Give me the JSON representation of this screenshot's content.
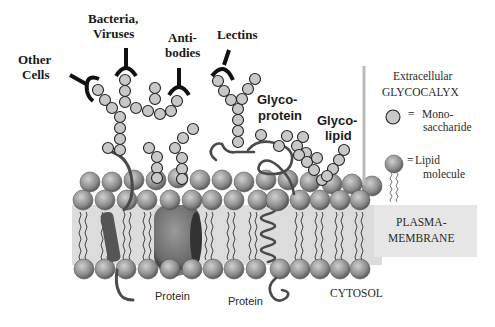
{
  "diagram": {
    "labels": {
      "other_cells_1": "Other",
      "other_cells_2": "Cells",
      "bacteria_1": "Bacteria,",
      "bacteria_2": "Viruses",
      "antibodies_1": "Anti-",
      "antibodies_2": "bodies",
      "lectins": "Lectins",
      "glycoprotein_1": "Glyco-",
      "glycoprotein_2": "protein",
      "glycolipid_1": "Glyco-",
      "glycolipid_2": "lipid",
      "protein_left": "Protein",
      "protein_right": "Protein",
      "cytosol": "CYTOSOL"
    },
    "legend": {
      "region_1": "Extracellular",
      "region_2": "GLYCOCALYX",
      "mono_eq": "=",
      "mono_1": "Mono-",
      "mono_2": "saccharide",
      "lipid_eq": "=",
      "lipid_1": "Lipid",
      "lipid_2": "molecule",
      "membrane_1": "PLASMA-",
      "membrane_2": "MEMBRANE"
    },
    "colors": {
      "sugar_fill": "#c8c8c8",
      "sugar_stroke": "#222222",
      "lipid_head": "#8c8c8c",
      "membrane_band": "#dcdcdc",
      "protein": "#5a5a5a",
      "receptor": "#111111"
    }
  }
}
